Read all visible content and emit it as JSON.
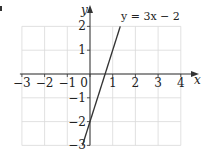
{
  "chart_data": {
    "type": "line",
    "title": "",
    "xlabel": "x",
    "ylabel": "y",
    "xlim": [
      -3,
      4
    ],
    "ylim": [
      -3,
      2
    ],
    "grid": true,
    "xticks": [
      -3,
      -2,
      -1,
      0,
      1,
      2,
      3,
      4
    ],
    "yticks": [
      -3,
      -2,
      -1,
      1,
      2
    ],
    "xtick_labels": [
      "−3",
      "−2",
      "−1",
      "0",
      "1",
      "2",
      "3",
      "4"
    ],
    "ytick_labels": [
      "−3",
      "−2",
      "−1",
      "1",
      "2"
    ],
    "series": [
      {
        "name": "y = 3x − 2",
        "equation": "y = 3x − 2",
        "x": [
          -0.333,
          1.333
        ],
        "y": [
          -3,
          2
        ],
        "color": "#333333"
      }
    ],
    "annotations": [
      {
        "text": "y = 3x − 2",
        "x": 1.4,
        "y": 2.2
      }
    ]
  },
  "labels": {
    "x_axis": "x",
    "y_axis": "y",
    "equation": "y = 3x − 2"
  },
  "colors": {
    "grid": "#d9d9d9",
    "axis": "#333333",
    "line": "#333333"
  }
}
